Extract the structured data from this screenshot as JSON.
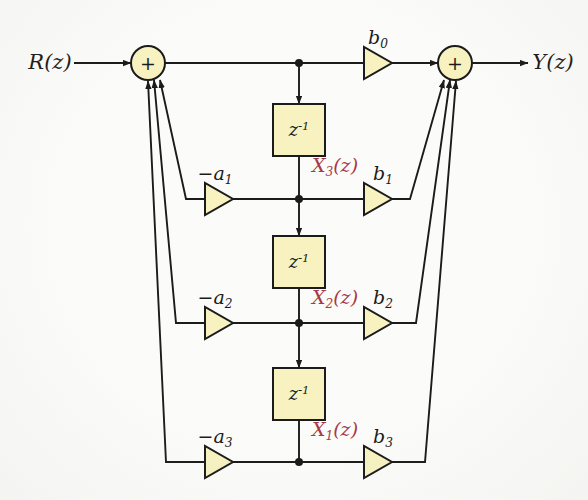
{
  "diagram": {
    "background_color": "#fbfbf9",
    "line_color": "#1b1b1b",
    "block_fill_color": "#f7f2c0",
    "block_stroke_color": "#1b1b1b",
    "node_fill_color": "#f7f2c0",
    "state_label_color": "#a63a46"
  },
  "io": {
    "input_label": "R(z)",
    "input_base": "R",
    "input_arg": "(z)",
    "output_label": "Y(z)",
    "output_base": "Y",
    "output_arg": "(z)"
  },
  "adders": [
    {
      "name": "input-adder",
      "symbol": "+",
      "x": 148,
      "y": 63
    },
    {
      "name": "output-adder",
      "symbol": "+",
      "x": 455,
      "y": 63
    }
  ],
  "delays": [
    {
      "name": "delay-1",
      "base": "z",
      "exp": "-1",
      "x": 299,
      "y": 130
    },
    {
      "name": "delay-2",
      "base": "z",
      "exp": "-1",
      "x": 299,
      "y": 262
    },
    {
      "name": "delay-3",
      "base": "z",
      "exp": "-1",
      "x": 299,
      "y": 394
    }
  ],
  "states": [
    {
      "name": "state-x3",
      "base": "X",
      "index": "3",
      "arg": "(z)",
      "label": "X3(z)",
      "x": 335,
      "y": 167
    },
    {
      "name": "state-x2",
      "base": "X",
      "index": "2",
      "arg": "(z)",
      "label": "X2(z)",
      "x": 335,
      "y": 299
    },
    {
      "name": "state-x1",
      "base": "X",
      "index": "1",
      "arg": "(z)",
      "label": "X1(z)",
      "x": 335,
      "y": 431
    }
  ],
  "feedforward_gains": [
    {
      "name": "gain-b0",
      "base": "b",
      "index": "0",
      "label": "b0",
      "x": 378,
      "y": 63,
      "label_x": 378,
      "label_y": 39
    },
    {
      "name": "gain-b1",
      "base": "b",
      "index": "1",
      "label": "b1",
      "x": 378,
      "y": 199,
      "label_x": 383,
      "label_y": 175
    },
    {
      "name": "gain-b2",
      "base": "b",
      "index": "2",
      "label": "b2",
      "x": 378,
      "y": 323,
      "label_x": 383,
      "label_y": 299
    },
    {
      "name": "gain-b3",
      "base": "b",
      "index": "3",
      "label": "b3",
      "x": 378,
      "y": 462,
      "label_x": 383,
      "label_y": 438
    }
  ],
  "feedback_gains": [
    {
      "name": "gain-a1",
      "sign": "−",
      "base": "a",
      "index": "1",
      "label": "−a1",
      "x": 219,
      "y": 199,
      "label_x": 215,
      "label_y": 175
    },
    {
      "name": "gain-a2",
      "sign": "−",
      "base": "a",
      "index": "2",
      "label": "−a2",
      "x": 219,
      "y": 323,
      "label_x": 215,
      "label_y": 299
    },
    {
      "name": "gain-a3",
      "sign": "−",
      "base": "a",
      "index": "3",
      "label": "−a3",
      "x": 219,
      "y": 462,
      "label_x": 215,
      "label_y": 438
    }
  ],
  "tap_nodes": [
    {
      "name": "tap-node-top",
      "x": 299,
      "y": 63
    },
    {
      "name": "tap-node-x3",
      "x": 299,
      "y": 199
    },
    {
      "name": "tap-node-x2",
      "x": 299,
      "y": 323
    },
    {
      "name": "tap-node-x1",
      "x": 299,
      "y": 462
    }
  ]
}
